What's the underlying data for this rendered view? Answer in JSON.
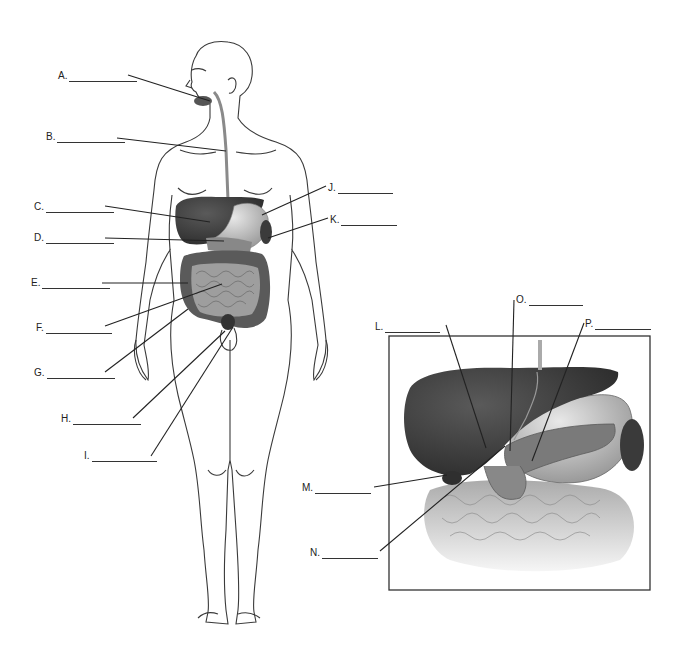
{
  "diagram": {
    "figures": [
      {
        "name": "full-body-figure",
        "description": "Anterior view of human body with digestive organs"
      },
      {
        "name": "inset-upper-abdomen",
        "description": "Inset close-up of liver, stomach, pancreas, gallbladder and intestines"
      }
    ],
    "labels": [
      {
        "id": "A",
        "text": "A.",
        "x": 58,
        "y": 70,
        "blank_w": 68,
        "line": [
          128,
          75,
          210,
          101
        ]
      },
      {
        "id": "B",
        "text": "B.",
        "x": 46,
        "y": 131,
        "blank_w": 68,
        "line": [
          117,
          138,
          226,
          151
        ]
      },
      {
        "id": "C",
        "text": "C.",
        "x": 34,
        "y": 201,
        "blank_w": 68,
        "line": [
          105,
          206,
          210,
          222
        ]
      },
      {
        "id": "D",
        "text": "D.",
        "x": 34,
        "y": 232,
        "blank_w": 68,
        "line": [
          105,
          238,
          224,
          241
        ]
      },
      {
        "id": "E",
        "text": "E.",
        "x": 31,
        "y": 277,
        "blank_w": 68,
        "line": [
          102,
          283,
          188,
          283
        ]
      },
      {
        "id": "F",
        "text": "F.",
        "x": 36,
        "y": 322,
        "blank_w": 66,
        "line": [
          105,
          326,
          222,
          284
        ]
      },
      {
        "id": "G",
        "text": "G.",
        "x": 34,
        "y": 367,
        "blank_w": 68,
        "line": [
          105,
          372,
          188,
          309
        ]
      },
      {
        "id": "H",
        "text": "H.",
        "x": 61,
        "y": 413,
        "blank_w": 68,
        "line": [
          133,
          418,
          225,
          331
        ]
      },
      {
        "id": "I",
        "text": "I.",
        "x": 84,
        "y": 450,
        "blank_w": 65,
        "line": [
          151,
          456,
          233,
          327
        ]
      },
      {
        "id": "J",
        "text": "J.",
        "x": 328,
        "y": 182,
        "blank_w": 55,
        "line": [
          326,
          186,
          262,
          215
        ]
      },
      {
        "id": "K",
        "text": "K.",
        "x": 330,
        "y": 214,
        "blank_w": 56,
        "line": [
          328,
          218,
          268,
          238
        ]
      },
      {
        "id": "L",
        "text": "L.",
        "x": 375,
        "y": 321,
        "blank_w": 55,
        "line": [
          446,
          325,
          486,
          448
        ]
      },
      {
        "id": "M",
        "text": "M.",
        "x": 302,
        "y": 482,
        "blank_w": 56,
        "line": [
          374,
          487,
          447,
          475
        ]
      },
      {
        "id": "N",
        "text": "N.",
        "x": 310,
        "y": 547,
        "blank_w": 56,
        "line": [
          380,
          551,
          505,
          446
        ]
      },
      {
        "id": "O",
        "text": "O.",
        "x": 516,
        "y": 294,
        "blank_w": 54,
        "line": [
          514,
          300,
          510,
          451
        ]
      },
      {
        "id": "P",
        "text": "P.",
        "x": 585,
        "y": 318,
        "blank_w": 56,
        "line": [
          584,
          323,
          532,
          461
        ]
      }
    ]
  }
}
